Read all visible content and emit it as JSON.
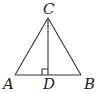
{
  "diagram": {
    "type": "triangle-with-altitude",
    "points": {
      "A": {
        "label": "A",
        "x": 15,
        "y": 75
      },
      "B": {
        "label": "B",
        "x": 81,
        "y": 75
      },
      "C": {
        "label": "C",
        "x": 48,
        "y": 18
      },
      "D": {
        "label": "D",
        "x": 48,
        "y": 75
      }
    },
    "segments": [
      "AB",
      "AC",
      "BC",
      "CD"
    ],
    "right_angle_at": "D",
    "colors": {
      "line": "#333333",
      "text": "#222222"
    }
  }
}
